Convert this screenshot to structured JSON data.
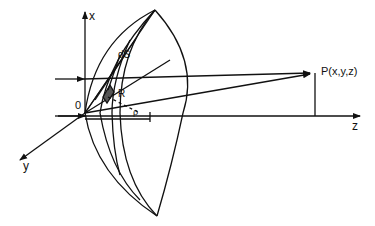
{
  "diagram": {
    "labels": {
      "x_axis": "x",
      "y_axis": "y",
      "z_axis": "z",
      "origin": "0",
      "surface_element": "dS",
      "distance": "R",
      "angle": "ρ",
      "point": "P(x,y,z)"
    },
    "colors": {
      "ink": "#111111",
      "background": "#ffffff"
    }
  }
}
